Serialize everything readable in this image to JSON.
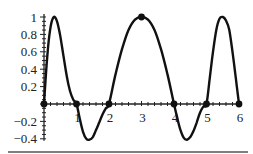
{
  "chart_data": {
    "type": "line",
    "title": "",
    "xlabel": "",
    "ylabel": "",
    "xlim": [
      0,
      6
    ],
    "ylim": [
      -0.4,
      1
    ],
    "grid": false,
    "legend": null,
    "x_ticks": [
      1,
      2,
      3,
      4,
      5,
      6
    ],
    "x_tick_labels": [
      "1",
      "2",
      "3",
      "4",
      "5",
      "6"
    ],
    "y_ticks": [
      1,
      0.8,
      0.6,
      0.4,
      0.2,
      -0.2,
      -0.4
    ],
    "y_tick_labels": [
      "1",
      "0.8",
      "0.6",
      "0.4",
      "0.2",
      "−0.2",
      "−0.4"
    ],
    "series": [
      {
        "name": "curve",
        "color": "#111111",
        "x": [
          0,
          0.1,
          0.2,
          0.3,
          0.4,
          0.5,
          0.6,
          0.7,
          0.8,
          0.9,
          1.0,
          1.1,
          1.2,
          1.3,
          1.4,
          1.5,
          1.6,
          1.7,
          1.8,
          1.9,
          2.0,
          2.2,
          2.4,
          2.6,
          2.8,
          3.0,
          3.2,
          3.4,
          3.6,
          3.8,
          4.0,
          4.1,
          4.2,
          4.3,
          4.4,
          4.5,
          4.6,
          4.7,
          4.8,
          4.9,
          5.0,
          5.1,
          5.2,
          5.3,
          5.4,
          5.5,
          5.6,
          5.7,
          5.8,
          5.9,
          6.0
        ],
        "y": [
          0,
          0.55,
          0.88,
          1.0,
          0.95,
          0.78,
          0.55,
          0.32,
          0.15,
          0.05,
          0,
          -0.17,
          -0.32,
          -0.4,
          -0.41,
          -0.38,
          -0.3,
          -0.21,
          -0.12,
          -0.05,
          0,
          0.34,
          0.63,
          0.85,
          0.97,
          1.0,
          0.97,
          0.85,
          0.63,
          0.34,
          0,
          -0.16,
          -0.3,
          -0.39,
          -0.41,
          -0.38,
          -0.31,
          -0.21,
          -0.1,
          -0.03,
          0,
          0.3,
          0.6,
          0.85,
          0.98,
          1.0,
          0.96,
          0.85,
          0.6,
          0.3,
          0
        ]
      }
    ],
    "markers": [
      {
        "x": 0,
        "y": 0
      },
      {
        "x": 1,
        "y": 0
      },
      {
        "x": 2,
        "y": 0
      },
      {
        "x": 3,
        "y": 1
      },
      {
        "x": 4,
        "y": 0
      },
      {
        "x": 5,
        "y": 0
      },
      {
        "x": 6,
        "y": 0
      }
    ]
  },
  "layout": {
    "x0_px": 44,
    "x_scale_px": 32.5,
    "y0_px": 104,
    "y_scale_px": 87
  }
}
